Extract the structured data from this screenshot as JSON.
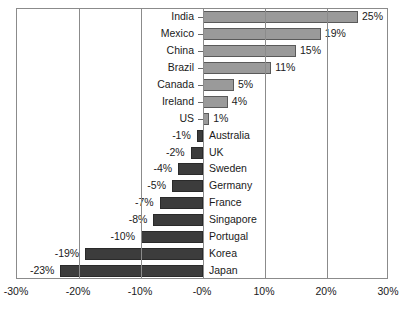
{
  "chart_data": {
    "type": "bar",
    "orientation": "horizontal",
    "title": "",
    "subtitle": "",
    "xlabel": "",
    "ylabel": "",
    "xlim": [
      -30,
      30
    ],
    "xtick_labels": [
      "-30%",
      "-20%",
      "-10%",
      "-0%",
      "10%",
      "20%",
      "30%"
    ],
    "xtick_values": [
      -30,
      -20,
      -10,
      0,
      10,
      20,
      30
    ],
    "grid": true,
    "legend": false,
    "categories": [
      "India",
      "Mexico",
      "China",
      "Brazil",
      "Canada",
      "Ireland",
      "US",
      "Australia",
      "UK",
      "Sweden",
      "Germany",
      "France",
      "Singapore",
      "Portugal",
      "Korea",
      "Japan"
    ],
    "values": [
      25,
      19,
      15,
      11,
      5,
      4,
      1,
      -1,
      -2,
      -4,
      -5,
      -7,
      -8,
      -10,
      -19,
      -23
    ],
    "data_labels": [
      "25%",
      "19%",
      "15%",
      "11%",
      "5%",
      "4%",
      "1%",
      "-1%",
      "-2%",
      "-4%",
      "-5%",
      "-7%",
      "-8%",
      "-10%",
      "-19%",
      "-23%"
    ],
    "colors": {
      "positive_bar": "#9a9a9a",
      "negative_bar": "#3c3c3c",
      "bar_outline": "#5a5a5a",
      "frame": "#8b8b8b",
      "text": "#1a1a1a",
      "background": "#ffffff"
    }
  }
}
